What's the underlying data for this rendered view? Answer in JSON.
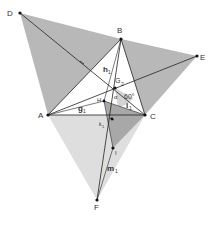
{
  "diagram": {
    "colors": {
      "shade_dark": "#aaaaaa",
      "shade_mid": "#c4c4c4",
      "shade_light": "#dcdcdc",
      "line": "#222222",
      "point": "#111111",
      "label": "#333333"
    },
    "points": {
      "D": {
        "label": "D",
        "x": 20,
        "y": 13
      },
      "B": {
        "label": "B",
        "x": 121,
        "y": 39
      },
      "E": {
        "label": "E",
        "x": 197,
        "y": 56
      },
      "A": {
        "label": "A",
        "x": 48,
        "y": 115
      },
      "C": {
        "label": "C",
        "x": 145,
        "y": 115
      },
      "F": {
        "label": "F",
        "x": 97,
        "y": 200
      },
      "G": {
        "label": "G",
        "x": 115,
        "y": 88
      },
      "H": {
        "label": "H",
        "x": 104,
        "y": 101
      },
      "K": {
        "label": "",
        "x": 112,
        "y": 119
      },
      "I": {
        "label": "I",
        "x": 113,
        "y": 148
      }
    },
    "line_labels": {
      "h": "h",
      "h_sub": "1",
      "g": "g",
      "g_sub": "1",
      "i": "i",
      "i_sub": "1",
      "k": "k",
      "k_sub": "1",
      "m": "m",
      "m_sub": "1",
      "G_sub": "2"
    },
    "angles": {
      "alpha": "α",
      "sixty": "60°"
    }
  }
}
